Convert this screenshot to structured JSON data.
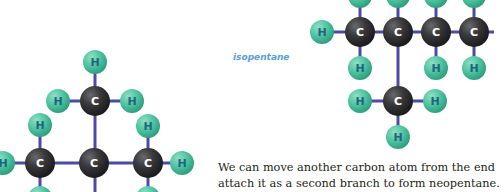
{
  "colors": {
    "carbon": "#3a3a3c",
    "hydrogen": "#4fc3a0",
    "bond": "#4b4ba3",
    "hydrogen_label": "#1d6680",
    "carbon_label": "#ffffff",
    "caption": "#5aa0d6"
  },
  "labels": {
    "carbon": "C",
    "hydrogen": "H"
  },
  "caption": "isopentane",
  "body_text": {
    "line1": "We can move another carbon atom from the end",
    "line2": "attach it as a second branch to form neopentane."
  },
  "molecules": [
    {
      "name": "neopentane-partial",
      "bonds": [
        [
          95,
          62,
          95,
          101
        ],
        [
          58,
          101,
          132,
          101
        ],
        [
          95,
          101,
          95,
          192
        ],
        [
          3,
          163,
          182,
          163
        ],
        [
          40,
          125,
          40,
          192
        ],
        [
          148,
          125,
          148,
          192
        ]
      ],
      "carbons": [
        [
          95,
          101
        ],
        [
          40,
          163
        ],
        [
          94,
          163
        ],
        [
          148,
          163
        ]
      ],
      "hydrogens": [
        [
          95,
          62
        ],
        [
          58,
          101
        ],
        [
          132,
          101
        ],
        [
          40,
          125
        ],
        [
          148,
          126
        ],
        [
          3,
          163
        ],
        [
          182,
          163
        ],
        [
          40,
          198
        ],
        [
          148,
          198
        ]
      ]
    },
    {
      "name": "isopentane",
      "bonds": [
        [
          322,
          32,
          494,
          32
        ],
        [
          360,
          0,
          360,
          68
        ],
        [
          398,
          0,
          398,
          101
        ],
        [
          436,
          0,
          436,
          68
        ],
        [
          474,
          0,
          474,
          68
        ],
        [
          360,
          101,
          435,
          101
        ],
        [
          398,
          101,
          398,
          137
        ]
      ],
      "carbons": [
        [
          360,
          32
        ],
        [
          398,
          32
        ],
        [
          436,
          32
        ],
        [
          474,
          32
        ],
        [
          398,
          101
        ]
      ],
      "hydrogens": [
        [
          322,
          32
        ],
        [
          360,
          -4
        ],
        [
          398,
          -4
        ],
        [
          436,
          -4
        ],
        [
          474,
          -4
        ],
        [
          360,
          68
        ],
        [
          436,
          68
        ],
        [
          474,
          68
        ],
        [
          360,
          101
        ],
        [
          435,
          101
        ],
        [
          398,
          137
        ]
      ]
    }
  ]
}
